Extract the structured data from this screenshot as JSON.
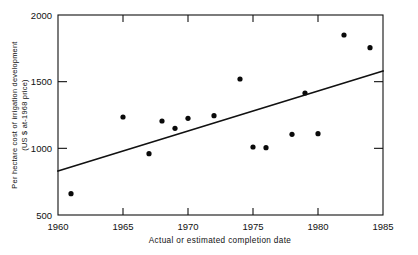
{
  "chart_data": {
    "type": "scatter",
    "title": "",
    "xlabel": "Actual or estimated completion date",
    "ylabel_line1": "Per hectare cost of irrigation development",
    "ylabel_line2": "(US $ at-1968 price)",
    "xlim": [
      1960,
      1985
    ],
    "ylim": [
      500,
      2000
    ],
    "xticks": [
      1960,
      1965,
      1970,
      1975,
      1980,
      1985
    ],
    "xticklabels": [
      "1960",
      "1965",
      "1970",
      "1975",
      "1980",
      "1985"
    ],
    "yticks": [
      500,
      1000,
      1500,
      2000
    ],
    "yticklabels": [
      "500",
      "1000",
      "1500",
      "2000"
    ],
    "grid": false,
    "legend": null,
    "marker": "filled-circle",
    "marker_color": "#0a0a0a",
    "line_color": "#111111",
    "points": [
      {
        "x": 1961,
        "y": 660
      },
      {
        "x": 1965,
        "y": 1235
      },
      {
        "x": 1967,
        "y": 960
      },
      {
        "x": 1968,
        "y": 1205
      },
      {
        "x": 1969,
        "y": 1150
      },
      {
        "x": 1970,
        "y": 1225
      },
      {
        "x": 1972,
        "y": 1245
      },
      {
        "x": 1974,
        "y": 1520
      },
      {
        "x": 1975,
        "y": 1010
      },
      {
        "x": 1976,
        "y": 1005
      },
      {
        "x": 1978,
        "y": 1105
      },
      {
        "x": 1979,
        "y": 1415
      },
      {
        "x": 1980,
        "y": 1110
      },
      {
        "x": 1982,
        "y": 1850
      },
      {
        "x": 1984,
        "y": 1755
      }
    ],
    "series": [
      {
        "name": "cost observations",
        "x": [
          1961,
          1965,
          1967,
          1968,
          1969,
          1970,
          1972,
          1974,
          1975,
          1976,
          1978,
          1979,
          1980,
          1982,
          1984
        ],
        "values": [
          660,
          1235,
          960,
          1205,
          1150,
          1225,
          1245,
          1520,
          1010,
          1005,
          1105,
          1415,
          1110,
          1850,
          1755
        ]
      }
    ],
    "trendline": {
      "name": "fitted regression line",
      "x": [
        1960,
        1985
      ],
      "y": [
        830,
        1580
      ]
    }
  }
}
